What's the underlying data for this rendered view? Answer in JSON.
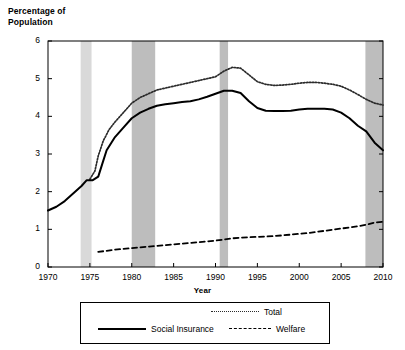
{
  "chart_data": {
    "type": "line",
    "title": "",
    "ylabel_line1": "Percentage of",
    "ylabel_line2": "Population",
    "xlabel": "Year",
    "xlim": [
      1970,
      2010
    ],
    "ylim": [
      0,
      6
    ],
    "yticks": [
      "0",
      "1",
      "2",
      "3",
      "4",
      "5",
      "6"
    ],
    "xticks": [
      "1970",
      "1975",
      "1980",
      "1985",
      "1990",
      "1995",
      "2000",
      "2005",
      "2010"
    ],
    "grid": false,
    "legend_position": "below-plot",
    "legend": [
      {
        "name": "Total",
        "style": "dotted",
        "color": "#2b2b2b"
      },
      {
        "name": "Social Insurance",
        "style": "solid",
        "color": "#000000"
      },
      {
        "name": "Welfare",
        "style": "dashed",
        "color": "#000000"
      }
    ],
    "recession_bands": [
      {
        "start": 1973.9,
        "end": 1975.2,
        "color": "#d9d9d9"
      },
      {
        "start": 1980.0,
        "end": 1982.8,
        "color": "#bdbdbd"
      },
      {
        "start": 1990.5,
        "end": 1991.5,
        "color": "#bdbdbd"
      },
      {
        "start": 2007.9,
        "end": 2010.0,
        "color": "#bdbdbd"
      }
    ],
    "series": [
      {
        "name": "Total",
        "style": "dotted",
        "x": [
          1975.0,
          1975.6,
          1976.0,
          1976.6,
          1977.3,
          1978.0,
          1979.0,
          1980.0,
          1981.0,
          1982.0,
          1983.0,
          1984.0,
          1985.0,
          1986.0,
          1987.0,
          1988.0,
          1989.0,
          1990.0,
          1991.0,
          1992.0,
          1993.0,
          1994.0,
          1995.0,
          1996.0,
          1997.0,
          1998.0,
          1999.0,
          2000.0,
          2001.0,
          2002.0,
          2003.0,
          2004.0,
          2005.0,
          2006.0,
          2007.0,
          2008.0,
          2009.0,
          2010.0
        ],
        "y": [
          2.33,
          2.55,
          2.95,
          3.35,
          3.65,
          3.85,
          4.1,
          4.35,
          4.5,
          4.6,
          4.7,
          4.75,
          4.8,
          4.85,
          4.9,
          4.95,
          5.0,
          5.05,
          5.2,
          5.3,
          5.28,
          5.1,
          4.92,
          4.85,
          4.82,
          4.83,
          4.85,
          4.88,
          4.9,
          4.9,
          4.88,
          4.85,
          4.8,
          4.7,
          4.58,
          4.45,
          4.35,
          4.3
        ]
      },
      {
        "name": "Social Insurance",
        "style": "solid",
        "x": [
          1970.0,
          1971.0,
          1972.0,
          1973.0,
          1974.0,
          1974.6,
          1975.3,
          1976.0,
          1976.5,
          1977.0,
          1978.0,
          1979.0,
          1980.0,
          1981.0,
          1982.0,
          1983.0,
          1984.0,
          1985.0,
          1986.0,
          1987.0,
          1988.0,
          1989.0,
          1990.0,
          1991.0,
          1992.0,
          1993.0,
          1994.0,
          1995.0,
          1996.0,
          1997.0,
          1998.0,
          1999.0,
          2000.0,
          2001.0,
          2002.0,
          2003.0,
          2004.0,
          2005.0,
          2006.0,
          2007.0,
          2008.0,
          2009.0,
          2010.0
        ],
        "y": [
          1.5,
          1.6,
          1.75,
          1.95,
          2.15,
          2.3,
          2.3,
          2.4,
          2.75,
          3.1,
          3.45,
          3.7,
          3.95,
          4.1,
          4.2,
          4.28,
          4.32,
          4.35,
          4.38,
          4.4,
          4.45,
          4.52,
          4.6,
          4.68,
          4.68,
          4.62,
          4.4,
          4.22,
          4.15,
          4.14,
          4.14,
          4.15,
          4.18,
          4.2,
          4.2,
          4.2,
          4.18,
          4.1,
          3.95,
          3.75,
          3.6,
          3.3,
          3.1
        ]
      },
      {
        "name": "Welfare",
        "style": "dashed",
        "x": [
          1976.0,
          1977.0,
          1978.0,
          1979.0,
          1980.0,
          1981.0,
          1982.0,
          1983.0,
          1984.0,
          1985.0,
          1986.0,
          1987.0,
          1988.0,
          1989.0,
          1990.0,
          1991.0,
          1992.0,
          1993.0,
          1994.0,
          1995.0,
          1996.0,
          1997.0,
          1998.0,
          1999.0,
          2000.0,
          2001.0,
          2002.0,
          2003.0,
          2004.0,
          2005.0,
          2006.0,
          2007.0,
          2008.0,
          2009.0,
          2010.0
        ],
        "y": [
          0.4,
          0.43,
          0.46,
          0.48,
          0.5,
          0.52,
          0.54,
          0.56,
          0.58,
          0.6,
          0.62,
          0.64,
          0.66,
          0.68,
          0.7,
          0.73,
          0.76,
          0.78,
          0.79,
          0.8,
          0.81,
          0.82,
          0.84,
          0.86,
          0.88,
          0.9,
          0.93,
          0.96,
          0.99,
          1.02,
          1.05,
          1.08,
          1.12,
          1.18,
          1.2
        ]
      }
    ]
  }
}
